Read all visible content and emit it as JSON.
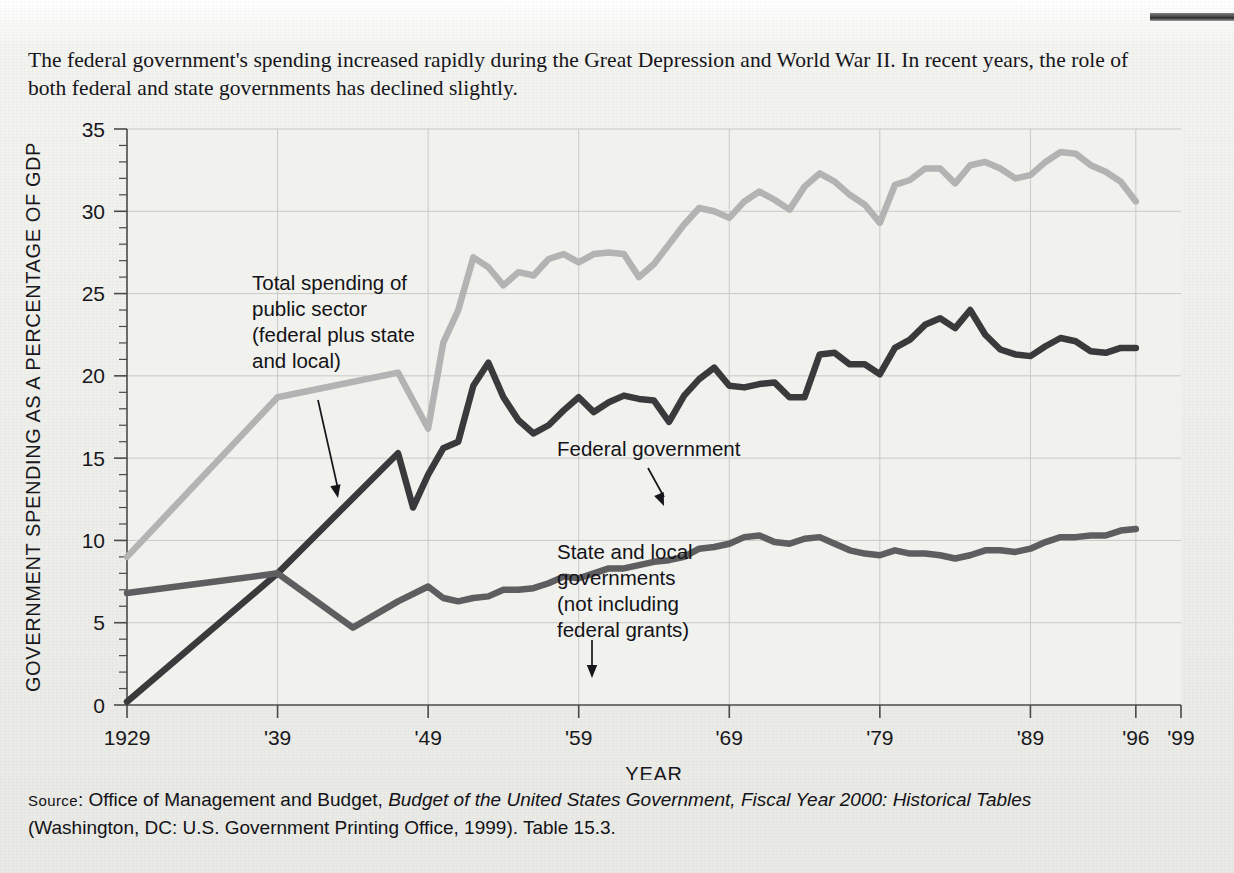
{
  "figure": {
    "caption": "The federal government's spending increased rapidly during the Great Depression and World War II. In recent years, the role of both federal and state governments has declined slightly.",
    "source_prefix": "Source",
    "source_line1_a": ": Office of Management and Budget, ",
    "source_line1_italic": "Budget of the United States Government, Fiscal Year 2000: Historical Tables",
    "source_line2": "(Washington, DC: U.S. Government Printing Office, 1999). Table 15.3."
  },
  "colors": {
    "total_public_sector": "#b3b3b3",
    "federal": "#3a3a3c",
    "state_local": "#5e5e60",
    "grid": "#c9c9c6",
    "axis": "#4a4a4a",
    "text": "#18181c",
    "paper": "#eeeeea"
  },
  "annotations": [
    {
      "name": "total-public-sector",
      "lines": [
        "Total spending of",
        "public sector",
        "(federal plus state",
        "and local)"
      ],
      "text_x": 252,
      "text_y": 178,
      "arrow": {
        "x1": 318,
        "y1": 288,
        "x2": 338,
        "y2": 386
      }
    },
    {
      "name": "federal-government",
      "lines": [
        "Federal government"
      ],
      "text_x": 557,
      "text_y": 344,
      "arrow": {
        "x1": 648,
        "y1": 356,
        "x2": 664,
        "y2": 394
      }
    },
    {
      "name": "state-and-local",
      "lines": [
        "State and local",
        "governments",
        "(not including",
        "federal grants)"
      ],
      "text_x": 557,
      "text_y": 447,
      "arrow": {
        "x1": 592,
        "y1": 528,
        "x2": 592,
        "y2": 566
      }
    }
  ],
  "chart_data": {
    "type": "line",
    "title": "",
    "xlabel": "YEAR",
    "ylabel": "GOVERNMENT SPENDING AS A PERCENTAGE OF GDP",
    "xlim": [
      1929,
      1999
    ],
    "ylim": [
      0,
      35
    ],
    "ytick_values": [
      0,
      5,
      10,
      15,
      20,
      25,
      30,
      35
    ],
    "ytick_labels": [
      "0",
      "5",
      "10",
      "15",
      "20",
      "25",
      "30",
      "35"
    ],
    "yminor_step": 1,
    "xtick_values": [
      1929,
      1939,
      1949,
      1959,
      1969,
      1979,
      1989,
      1996,
      1999
    ],
    "xtick_labels": [
      "1929",
      "'39",
      "'49",
      "'59",
      "'69",
      "'79",
      "'89",
      "'96",
      "'99"
    ],
    "grid": true,
    "grid_x_values": [
      1939,
      1949,
      1959,
      1969,
      1979,
      1989,
      1996
    ],
    "grid_y_values": [
      5,
      10,
      15,
      20,
      25,
      30,
      35
    ],
    "legend_position": "annotations-inline",
    "data_last_year": 1996,
    "series": [
      {
        "name": "Total spending of public sector (federal plus state and local)",
        "color": "#b3b3b3",
        "x": [
          1929,
          1939,
          1947,
          1949,
          1950,
          1951,
          1952,
          1953,
          1954,
          1955,
          1956,
          1957,
          1958,
          1959,
          1960,
          1961,
          1962,
          1963,
          1964,
          1965,
          1966,
          1967,
          1968,
          1969,
          1970,
          1971,
          1972,
          1973,
          1974,
          1975,
          1976,
          1977,
          1978,
          1979,
          1980,
          1981,
          1982,
          1983,
          1984,
          1985,
          1986,
          1987,
          1988,
          1989,
          1990,
          1991,
          1992,
          1993,
          1994,
          1995,
          1996
        ],
        "values": [
          9.0,
          18.7,
          20.2,
          16.8,
          22.0,
          24.0,
          27.2,
          26.6,
          25.5,
          26.3,
          26.1,
          27.1,
          27.4,
          26.9,
          27.4,
          27.5,
          27.4,
          26.0,
          26.8,
          28.0,
          29.2,
          30.2,
          30.0,
          29.6,
          30.6,
          31.2,
          30.7,
          30.1,
          31.5,
          32.3,
          31.8,
          31.0,
          30.4,
          29.3,
          31.6,
          31.9,
          32.6,
          32.6,
          31.7,
          32.8,
          33.0,
          32.6,
          32.0,
          32.2,
          33.0,
          33.6,
          33.5,
          32.8,
          32.4,
          31.8,
          30.6
        ]
      },
      {
        "name": "Federal government",
        "color": "#3a3a3c",
        "x": [
          1929,
          1939,
          1947,
          1948,
          1949,
          1950,
          1951,
          1952,
          1953,
          1954,
          1955,
          1956,
          1957,
          1958,
          1959,
          1960,
          1961,
          1962,
          1963,
          1964,
          1965,
          1966,
          1967,
          1968,
          1969,
          1970,
          1971,
          1972,
          1973,
          1974,
          1975,
          1976,
          1977,
          1978,
          1979,
          1980,
          1981,
          1982,
          1983,
          1984,
          1985,
          1986,
          1987,
          1988,
          1989,
          1990,
          1991,
          1992,
          1993,
          1994,
          1995,
          1996
        ],
        "values": [
          0.2,
          8.0,
          15.3,
          12.0,
          14.0,
          15.6,
          16.0,
          19.4,
          20.8,
          18.7,
          17.3,
          16.5,
          17.0,
          17.9,
          18.7,
          17.8,
          18.4,
          18.8,
          18.6,
          18.5,
          17.2,
          18.8,
          19.8,
          20.5,
          19.4,
          19.3,
          19.5,
          19.6,
          18.7,
          18.7,
          21.3,
          21.4,
          20.7,
          20.7,
          20.1,
          21.7,
          22.2,
          23.1,
          23.5,
          22.9,
          24.0,
          22.5,
          21.6,
          21.3,
          21.2,
          21.8,
          22.3,
          22.1,
          21.5,
          21.4,
          21.7,
          21.7
        ]
      },
      {
        "name": "State and local governments (not including federal grants)",
        "color": "#5e5e60",
        "x": [
          1929,
          1939,
          1944,
          1947,
          1949,
          1950,
          1951,
          1952,
          1953,
          1954,
          1955,
          1956,
          1957,
          1958,
          1959,
          1960,
          1961,
          1962,
          1963,
          1964,
          1965,
          1966,
          1967,
          1968,
          1969,
          1970,
          1971,
          1972,
          1973,
          1974,
          1975,
          1976,
          1977,
          1978,
          1979,
          1980,
          1981,
          1982,
          1983,
          1984,
          1985,
          1986,
          1987,
          1988,
          1989,
          1990,
          1991,
          1992,
          1993,
          1994,
          1995,
          1996
        ],
        "values": [
          6.8,
          8.0,
          4.7,
          6.3,
          7.2,
          6.5,
          6.3,
          6.5,
          6.6,
          7.0,
          7.0,
          7.1,
          7.4,
          7.8,
          7.7,
          8.0,
          8.3,
          8.3,
          8.5,
          8.7,
          8.8,
          9.0,
          9.5,
          9.6,
          9.8,
          10.2,
          10.3,
          9.9,
          9.8,
          10.1,
          10.2,
          9.8,
          9.4,
          9.2,
          9.1,
          9.4,
          9.2,
          9.2,
          9.1,
          8.9,
          9.1,
          9.4,
          9.4,
          9.3,
          9.5,
          9.9,
          10.2,
          10.2,
          10.3,
          10.3,
          10.6,
          10.7
        ]
      }
    ]
  }
}
